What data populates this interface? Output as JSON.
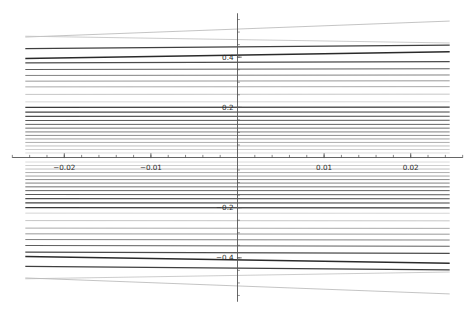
{
  "chart_data": {
    "type": "line",
    "title": "",
    "subtitle": "",
    "xlabel": "",
    "ylabel": "",
    "xlim": [
      -0.0265,
      0.0265
    ],
    "ylim": [
      -0.58,
      0.58
    ],
    "grid": false,
    "legend": "none",
    "axis_style": "centered-spines",
    "background": "#ffffff",
    "axis_color": "#555555",
    "xaxis": {
      "major_ticks": [
        -0.02,
        -0.01,
        0.01,
        0.02
      ],
      "major_tick_labels": [
        "−0.02",
        "−0.01",
        "0.01",
        "0.02"
      ],
      "minor_tick_step": 0.002,
      "minor_tick_count": 27,
      "label_offset_y": 12
    },
    "yaxis": {
      "major_ticks": [
        0.4,
        0.2,
        -0.2,
        -0.4
      ],
      "major_tick_labels": [
        "0.4",
        "0.2",
        "−0.2",
        "−0.4"
      ],
      "minor_tick_step": 0.05,
      "label_offset_x": -4
    },
    "x_domain_drawn": [
      -0.0245,
      0.0245
    ],
    "series_description": "Family of near-horizontal lines y = intercept + slope*x, antisymmetric about y = 0, with varying stroke darkness and width.",
    "series": [
      {
        "name": "L01",
        "intercept": 0.512,
        "slope": 1.3,
        "color": "#b9b9b9",
        "width": 0.85
      },
      {
        "name": "L02",
        "intercept": 0.47,
        "slope": -0.55,
        "color": "#c3c3c3",
        "width": 0.85
      },
      {
        "name": "L03",
        "intercept": 0.441,
        "slope": 0.3,
        "color": "#3f3f3f",
        "width": 1.25
      },
      {
        "name": "L04",
        "intercept": 0.408,
        "slope": 0.55,
        "color": "#2a2a2a",
        "width": 1.45
      },
      {
        "name": "L05",
        "intercept": 0.38,
        "slope": 0.1,
        "color": "#4a4a4a",
        "width": 1.2
      },
      {
        "name": "L06",
        "intercept": 0.352,
        "slope": 0.06,
        "color": "#5e5e5e",
        "width": 1.05
      },
      {
        "name": "L07",
        "intercept": 0.328,
        "slope": 0.04,
        "color": "#7b7b7b",
        "width": 0.95
      },
      {
        "name": "L08",
        "intercept": 0.305,
        "slope": 0.03,
        "color": "#8d8d8d",
        "width": 0.9
      },
      {
        "name": "L09",
        "intercept": 0.282,
        "slope": 0.02,
        "color": "#a0a0a0",
        "width": 0.9
      },
      {
        "name": "L10",
        "intercept": 0.252,
        "slope": 0.02,
        "color": "#bcbcbc",
        "width": 0.85
      },
      {
        "name": "L11",
        "intercept": 0.222,
        "slope": 0.01,
        "color": "#cdcdcd",
        "width": 0.85
      },
      {
        "name": "L12",
        "intercept": 0.2,
        "slope": 0.02,
        "color": "#3a3a3a",
        "width": 1.25
      },
      {
        "name": "L13",
        "intercept": 0.181,
        "slope": 0.01,
        "color": "#444444",
        "width": 1.15
      },
      {
        "name": "L14",
        "intercept": 0.164,
        "slope": 0.01,
        "color": "#4e4e4e",
        "width": 1.1
      },
      {
        "name": "L15",
        "intercept": 0.148,
        "slope": 0.01,
        "color": "#585858",
        "width": 1.05
      },
      {
        "name": "L16",
        "intercept": 0.132,
        "slope": 0.0,
        "color": "#636363",
        "width": 1.0
      },
      {
        "name": "L17",
        "intercept": 0.117,
        "slope": 0.0,
        "color": "#6e6e6e",
        "width": 1.0
      },
      {
        "name": "L18",
        "intercept": 0.102,
        "slope": 0.0,
        "color": "#7a7a7a",
        "width": 0.95
      },
      {
        "name": "L19",
        "intercept": 0.088,
        "slope": 0.0,
        "color": "#888888",
        "width": 0.95
      },
      {
        "name": "L20",
        "intercept": 0.074,
        "slope": 0.0,
        "color": "#969696",
        "width": 0.9
      },
      {
        "name": "L21",
        "intercept": 0.06,
        "slope": 0.0,
        "color": "#a6a6a6",
        "width": 0.9
      },
      {
        "name": "L22",
        "intercept": 0.046,
        "slope": 0.0,
        "color": "#b6b6b6",
        "width": 0.88
      },
      {
        "name": "L23",
        "intercept": 0.032,
        "slope": 0.0,
        "color": "#c6c6c6",
        "width": 0.86
      },
      {
        "name": "L24",
        "intercept": 0.018,
        "slope": 0.0,
        "color": "#d4d4d4",
        "width": 0.85
      },
      {
        "name": "L25",
        "intercept": -0.018,
        "slope": 0.0,
        "color": "#d4d4d4",
        "width": 0.85
      },
      {
        "name": "L26",
        "intercept": -0.032,
        "slope": 0.0,
        "color": "#c6c6c6",
        "width": 0.86
      },
      {
        "name": "L27",
        "intercept": -0.046,
        "slope": 0.0,
        "color": "#b6b6b6",
        "width": 0.88
      },
      {
        "name": "L28",
        "intercept": -0.06,
        "slope": 0.0,
        "color": "#a6a6a6",
        "width": 0.9
      },
      {
        "name": "L29",
        "intercept": -0.074,
        "slope": 0.0,
        "color": "#969696",
        "width": 0.9
      },
      {
        "name": "L30",
        "intercept": -0.088,
        "slope": 0.0,
        "color": "#888888",
        "width": 0.95
      },
      {
        "name": "L31",
        "intercept": -0.102,
        "slope": 0.0,
        "color": "#7a7a7a",
        "width": 0.95
      },
      {
        "name": "L32",
        "intercept": -0.117,
        "slope": 0.0,
        "color": "#6e6e6e",
        "width": 1.0
      },
      {
        "name": "L33",
        "intercept": -0.132,
        "slope": 0.0,
        "color": "#636363",
        "width": 1.0
      },
      {
        "name": "L34",
        "intercept": -0.148,
        "slope": -0.01,
        "color": "#585858",
        "width": 1.05
      },
      {
        "name": "L35",
        "intercept": -0.164,
        "slope": -0.01,
        "color": "#4e4e4e",
        "width": 1.1
      },
      {
        "name": "L36",
        "intercept": -0.181,
        "slope": -0.01,
        "color": "#444444",
        "width": 1.15
      },
      {
        "name": "L37",
        "intercept": -0.2,
        "slope": -0.02,
        "color": "#3a3a3a",
        "width": 1.25
      },
      {
        "name": "L38",
        "intercept": -0.222,
        "slope": -0.01,
        "color": "#cdcdcd",
        "width": 0.85
      },
      {
        "name": "L39",
        "intercept": -0.252,
        "slope": -0.02,
        "color": "#bcbcbc",
        "width": 0.85
      },
      {
        "name": "L40",
        "intercept": -0.282,
        "slope": -0.02,
        "color": "#a0a0a0",
        "width": 0.9
      },
      {
        "name": "L41",
        "intercept": -0.305,
        "slope": -0.03,
        "color": "#8d8d8d",
        "width": 0.9
      },
      {
        "name": "L42",
        "intercept": -0.328,
        "slope": -0.04,
        "color": "#7b7b7b",
        "width": 0.95
      },
      {
        "name": "L43",
        "intercept": -0.352,
        "slope": -0.06,
        "color": "#5e5e5e",
        "width": 1.05
      },
      {
        "name": "L44",
        "intercept": -0.38,
        "slope": -0.1,
        "color": "#4a4a4a",
        "width": 1.2
      },
      {
        "name": "L45",
        "intercept": -0.408,
        "slope": -0.55,
        "color": "#2a2a2a",
        "width": 1.45
      },
      {
        "name": "L46",
        "intercept": -0.441,
        "slope": -0.3,
        "color": "#3f3f3f",
        "width": 1.25
      },
      {
        "name": "L47",
        "intercept": -0.47,
        "slope": 0.55,
        "color": "#c3c3c3",
        "width": 0.85
      },
      {
        "name": "L48",
        "intercept": -0.512,
        "slope": -1.3,
        "color": "#b9b9b9",
        "width": 0.85
      }
    ]
  }
}
